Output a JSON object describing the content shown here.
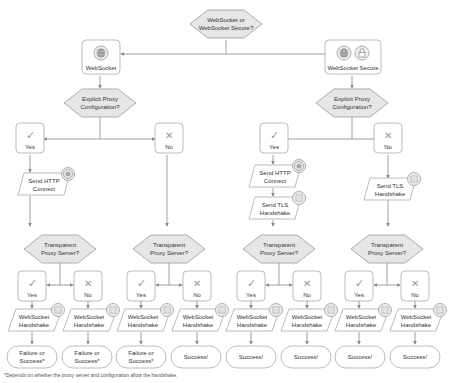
{
  "root": {
    "line1": "WebSocket or",
    "line2": "WebSocket Secure?"
  },
  "ws": {
    "label": "WebSocket",
    "icon": "globe-icon"
  },
  "wss": {
    "label": "WebSocket Secure",
    "icons": [
      "globe-icon",
      "lock-icon"
    ]
  },
  "explicit_proxy": {
    "line1": "Explicit Proxy",
    "line2": "Configuration?"
  },
  "yes": "Yes",
  "no": "No",
  "send_http": {
    "line1": "Send HTTP",
    "line2": "Connect"
  },
  "send_tls": {
    "line1": "Send TLS",
    "line2": "Handshake"
  },
  "transparent": {
    "line1": "Transparent",
    "line2": "Proxy Server?"
  },
  "ws_handshake": {
    "line1": "WebSocket",
    "line2": "Handshake"
  },
  "outcomes": [
    {
      "line1": "Failure or",
      "line2": "Success*"
    },
    {
      "line1": "Failure or",
      "line2": "Success*"
    },
    {
      "line1": "Failure or",
      "line2": "Success*"
    },
    {
      "line1": "Success!",
      "line2": ""
    },
    {
      "line1": "Success!",
      "line2": ""
    },
    {
      "line1": "Success!",
      "line2": ""
    },
    {
      "line1": "Success!",
      "line2": ""
    },
    {
      "line1": "Success!",
      "line2": ""
    }
  ],
  "footnote": "*Depends on whether the proxy server and configuration allow the handshake.",
  "colors": {
    "stroke": "#aaaaaa",
    "diamond_fill": "#e6e6e6",
    "box_fill": "#ffffff",
    "arrow": "#888888"
  }
}
